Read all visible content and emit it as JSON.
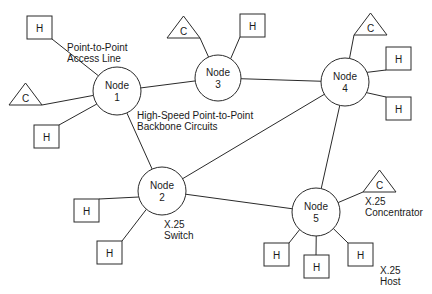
{
  "diagram": {
    "colors": {
      "stroke": "#2a2a2a",
      "text": "#1a1a1a",
      "background": "#ffffff"
    },
    "nodes": [
      {
        "id": "n1",
        "line1": "Node",
        "line2": "1",
        "cx": 117,
        "cy": 91,
        "r": 24
      },
      {
        "id": "n2",
        "line1": "Node",
        "line2": "2",
        "cx": 162,
        "cy": 191,
        "r": 24
      },
      {
        "id": "n3",
        "line1": "Node",
        "line2": "3",
        "cx": 218,
        "cy": 78,
        "r": 23
      },
      {
        "id": "n4",
        "line1": "Node",
        "line2": "4",
        "cx": 345,
        "cy": 82,
        "r": 24
      },
      {
        "id": "n5",
        "line1": "Node",
        "line2": "5",
        "cx": 316,
        "cy": 212,
        "r": 24
      }
    ],
    "hosts": [
      {
        "label": "H",
        "x": 27,
        "y": 16,
        "attached_to": "n1"
      },
      {
        "label": "H",
        "x": 34,
        "y": 125,
        "attached_to": "n1"
      },
      {
        "label": "H",
        "x": 240,
        "y": 14,
        "attached_to": "n3"
      },
      {
        "label": "H",
        "x": 386,
        "y": 47,
        "attached_to": "n4"
      },
      {
        "label": "H",
        "x": 386,
        "y": 97,
        "attached_to": "n4"
      },
      {
        "label": "H",
        "x": 74,
        "y": 199,
        "attached_to": "n2"
      },
      {
        "label": "H",
        "x": 97,
        "y": 241,
        "attached_to": "n2"
      },
      {
        "label": "H",
        "x": 264,
        "y": 243,
        "attached_to": "n5"
      },
      {
        "label": "H",
        "x": 304,
        "y": 255,
        "attached_to": "n5"
      },
      {
        "label": "H",
        "x": 348,
        "y": 243,
        "attached_to": "n5"
      }
    ],
    "concentrators": [
      {
        "label": "C",
        "x": 9,
        "y": 83,
        "attached_to": "n1"
      },
      {
        "label": "C",
        "x": 167,
        "y": 16,
        "attached_to": "n3"
      },
      {
        "label": "C",
        "x": 354,
        "y": 13,
        "attached_to": "n4"
      },
      {
        "label": "C",
        "x": 363,
        "y": 170,
        "attached_to": "n5"
      }
    ],
    "backbone_links": [
      [
        "n1",
        "n3"
      ],
      [
        "n3",
        "n4"
      ],
      [
        "n1",
        "n2"
      ],
      [
        "n2",
        "n4"
      ],
      [
        "n2",
        "n5"
      ],
      [
        "n4",
        "n5"
      ]
    ],
    "annotations": {
      "access_line": {
        "line1": "Point-to-Point",
        "line2": "Access Line"
      },
      "backbone": {
        "line1": "High-Speed Point-to-Point",
        "line2": "Backbone Circuits"
      },
      "switch": {
        "line1": "X.25",
        "line2": "Switch"
      },
      "concentrator": {
        "line1": "X.25",
        "line2": "Concentrator"
      },
      "host": {
        "line1": "X.25",
        "line2": "Host"
      }
    }
  }
}
